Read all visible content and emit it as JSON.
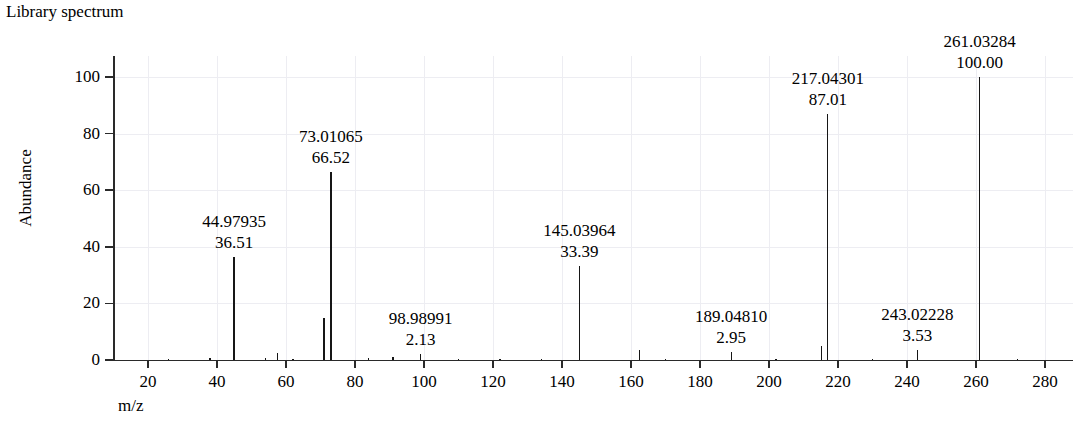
{
  "chart_data": {
    "type": "bar",
    "title": "Library spectrum",
    "xlabel": "m/z",
    "ylabel": "Abundance",
    "xlim": [
      10,
      292
    ],
    "ylim": [
      0,
      107
    ],
    "xticks": [
      20,
      40,
      60,
      80,
      100,
      120,
      140,
      160,
      180,
      200,
      220,
      240,
      260,
      280
    ],
    "yticks": [
      0,
      20,
      40,
      60,
      80,
      100
    ],
    "grid": "light gridlines at major x and y ticks",
    "legend": "none",
    "x": [
      26.0,
      38.0,
      44.97935,
      54.0,
      57.5,
      62.0,
      71.0,
      73.01065,
      84.0,
      91.0,
      98.98991,
      110.0,
      122.0,
      134.0,
      145.03964,
      162.5,
      170.0,
      189.0481,
      202.0,
      215.2,
      217.04301,
      230.0,
      243.02228,
      261.03284,
      272.0
    ],
    "values": [
      0.5,
      0.6,
      36.51,
      0.7,
      2.4,
      0.5,
      14.9,
      66.52,
      0.6,
      0.9,
      2.13,
      0.4,
      0.5,
      0.4,
      33.39,
      3.4,
      0.5,
      2.95,
      0.5,
      5.0,
      87.01,
      0.4,
      3.53,
      100.0,
      0.3
    ],
    "labeled_peaks": [
      {
        "mz": "44.97935",
        "abundance": "36.51",
        "x": 44.97935,
        "y": 36.51
      },
      {
        "mz": "73.01065",
        "abundance": "66.52",
        "x": 73.01065,
        "y": 66.52
      },
      {
        "mz": "98.98991",
        "abundance": "2.13",
        "x": 98.98991,
        "y": 2.13
      },
      {
        "mz": "145.03964",
        "abundance": "33.39",
        "x": 145.03964,
        "y": 33.39
      },
      {
        "mz": "189.04810",
        "abundance": "2.95",
        "x": 189.0481,
        "y": 2.95
      },
      {
        "mz": "217.04301",
        "abundance": "87.01",
        "x": 217.04301,
        "y": 87.01
      },
      {
        "mz": "243.02228",
        "abundance": "3.53",
        "x": 243.02228,
        "y": 3.53
      },
      {
        "mz": "261.03284",
        "abundance": "100.00",
        "x": 261.03284,
        "y": 100.0
      }
    ],
    "colors": {
      "peak": "#161616",
      "axis": "#2a2a2a",
      "grid": "#ededf2",
      "background": "#ffffff",
      "text": "#000000"
    }
  }
}
